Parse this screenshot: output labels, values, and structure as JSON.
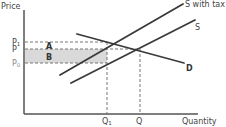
{
  "diagram": {
    "type": "supply-demand-tax",
    "axes": {
      "y_label": "Price",
      "x_label": "Quantity"
    },
    "price_levels": {
      "p1": {
        "label": "P",
        "subscript": "1"
      },
      "p": {
        "label": "P"
      },
      "p0": {
        "label": "P",
        "subscript": "0"
      }
    },
    "quantity_levels": {
      "q1": {
        "label": "Q",
        "subscript": "1"
      },
      "q": {
        "label": "Q"
      }
    },
    "curves": {
      "supply_with_tax": {
        "label": "S with tax"
      },
      "supply": {
        "label": "S"
      },
      "demand": {
        "label": "D"
      }
    },
    "areas": {
      "a": {
        "label": "A"
      },
      "b": {
        "label": "B"
      }
    },
    "colors": {
      "line": "#3a3a3a",
      "axis": "#555555",
      "dashed": "#777777",
      "shade": "#d9d9d9"
    }
  }
}
